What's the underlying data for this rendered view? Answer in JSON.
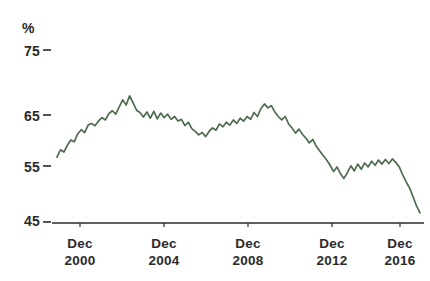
{
  "chart_data": {
    "type": "line",
    "title": "",
    "subtitle": "",
    "xlabel": "",
    "ylabel": "%",
    "unit_label": "%",
    "ylim": [
      45,
      75
    ],
    "y_ticks": [
      75,
      65,
      55,
      45
    ],
    "y_tick_labels": [
      "75",
      "65",
      "55",
      "45"
    ],
    "grid": false,
    "legend": false,
    "legend_position": "none",
    "line_color": "#4e6b4e",
    "axis_color": "#2b2b2b",
    "x_tick_labels": [
      {
        "month": "Dec",
        "year": "2000"
      },
      {
        "month": "Dec",
        "year": "2004"
      },
      {
        "month": "Dec",
        "year": "2008"
      },
      {
        "month": "Dec",
        "year": "2012"
      },
      {
        "month": "Dec",
        "year": "2016"
      }
    ],
    "x_range": [
      "1999-12",
      "2017-06"
    ],
    "series": [
      {
        "name": "series-1",
        "color": "#4e6b4e",
        "x": [
          "1999-12",
          "2000-02",
          "2000-04",
          "2000-06",
          "2000-08",
          "2000-10",
          "2000-12",
          "2001-02",
          "2001-04",
          "2001-06",
          "2001-08",
          "2001-10",
          "2001-12",
          "2002-02",
          "2002-04",
          "2002-06",
          "2002-08",
          "2002-10",
          "2002-12",
          "2003-02",
          "2003-04",
          "2003-06",
          "2003-08",
          "2003-10",
          "2003-12",
          "2004-02",
          "2004-04",
          "2004-06",
          "2004-08",
          "2004-10",
          "2004-12",
          "2005-02",
          "2005-04",
          "2005-06",
          "2005-08",
          "2005-10",
          "2005-12",
          "2006-02",
          "2006-04",
          "2006-06",
          "2006-08",
          "2006-10",
          "2006-12",
          "2007-02",
          "2007-04",
          "2007-06",
          "2007-08",
          "2007-10",
          "2007-12",
          "2008-02",
          "2008-04",
          "2008-06",
          "2008-08",
          "2008-10",
          "2008-12",
          "2009-02",
          "2009-04",
          "2009-06",
          "2009-08",
          "2009-10",
          "2009-12",
          "2010-02",
          "2010-04",
          "2010-06",
          "2010-08",
          "2010-10",
          "2010-12",
          "2011-02",
          "2011-04",
          "2011-06",
          "2011-08",
          "2011-10",
          "2011-12",
          "2012-02",
          "2012-04",
          "2012-06",
          "2012-08",
          "2012-10",
          "2012-12",
          "2013-02",
          "2013-04",
          "2013-06",
          "2013-08",
          "2013-10",
          "2013-12",
          "2014-02",
          "2014-04",
          "2014-06",
          "2014-08",
          "2014-10",
          "2014-12",
          "2015-02",
          "2015-04",
          "2015-06",
          "2015-08",
          "2015-10",
          "2015-12",
          "2016-02",
          "2016-04",
          "2016-06",
          "2016-08",
          "2016-10",
          "2016-12",
          "2017-02",
          "2017-04",
          "2017-06"
        ],
        "values": [
          56.3,
          57.6,
          57.2,
          58.4,
          59.3,
          59.0,
          60.4,
          61.1,
          60.6,
          61.9,
          62.2,
          61.8,
          62.6,
          63.2,
          62.8,
          63.9,
          64.4,
          63.8,
          65.1,
          66.3,
          65.4,
          67.0,
          65.8,
          64.5,
          64.1,
          63.3,
          64.2,
          63.1,
          64.3,
          63.0,
          64.0,
          63.2,
          63.8,
          62.9,
          63.4,
          62.6,
          62.9,
          61.8,
          62.4,
          61.3,
          60.8,
          60.2,
          60.6,
          59.9,
          60.8,
          61.4,
          61.0,
          62.1,
          61.6,
          62.4,
          61.9,
          62.8,
          62.2,
          63.1,
          62.6,
          63.4,
          62.9,
          64.1,
          63.4,
          64.8,
          65.6,
          64.9,
          65.3,
          64.2,
          63.4,
          62.8,
          63.4,
          62.1,
          61.4,
          60.5,
          61.2,
          60.3,
          59.6,
          58.8,
          59.4,
          58.2,
          57.4,
          56.6,
          55.8,
          54.9,
          53.8,
          54.6,
          53.4,
          52.6,
          53.6,
          54.8,
          53.9,
          55.1,
          54.2,
          55.3,
          54.6,
          55.6,
          54.9,
          55.8,
          55.1,
          55.9,
          55.2,
          56.0,
          55.4,
          54.6,
          53.2,
          52.0,
          50.9,
          49.4,
          47.8,
          46.6
        ]
      }
    ]
  }
}
